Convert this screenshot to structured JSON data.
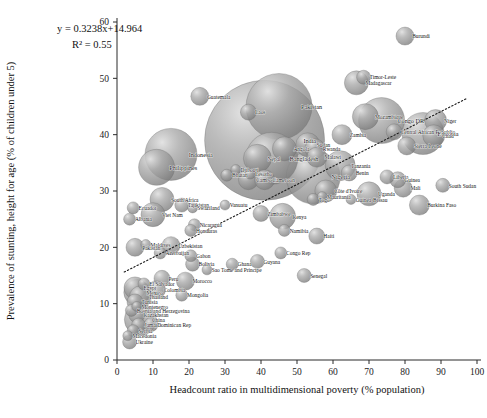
{
  "chart_data": {
    "type": "scatter",
    "title": "",
    "xlabel": "Headcount ratio in multidimensional poverty (% population)",
    "ylabel": "Prevalence of stunting, height for age (% of children under 5)",
    "xlim": [
      0,
      100
    ],
    "ylim": [
      0,
      60
    ],
    "xticks": [
      0,
      10,
      20,
      30,
      40,
      50,
      60,
      70,
      80,
      90,
      100
    ],
    "yticks": [
      0,
      10,
      20,
      30,
      40,
      50,
      60
    ],
    "grid": false,
    "legend": "none",
    "bubble_note": "Bubble area encodes population size; gray shaded spheres",
    "annotations": [
      {
        "name": "regression-equation",
        "text": "y = 0.3238x+14.964"
      },
      {
        "name": "r-squared",
        "text": "R² = 0.55"
      }
    ],
    "trendline": {
      "type": "linear",
      "style": "dotted",
      "slope": 0.3238,
      "intercept": 14.964,
      "r_squared": 0.55,
      "x_start": 2,
      "x_end": 97
    },
    "series": [
      {
        "name": "Countries",
        "points": [
          {
            "label": "Burundi",
            "x": 80.0,
            "y": 57.5,
            "size": 9
          },
          {
            "label": "Timor-Leste",
            "x": 68.5,
            "y": 50.2,
            "size": 7
          },
          {
            "label": "Madagascar",
            "x": 66.5,
            "y": 49.2,
            "size": 12
          },
          {
            "label": "Guatemala",
            "x": 23.0,
            "y": 46.8,
            "size": 9
          },
          {
            "label": "Pakistan",
            "x": 45.0,
            "y": 45.0,
            "size": 33
          },
          {
            "label": "Laos",
            "x": 36.5,
            "y": 44.0,
            "size": 8
          },
          {
            "label": "Mozambique",
            "x": 69.0,
            "y": 43.2,
            "size": 13
          },
          {
            "label": "Congo DR",
            "x": 73.5,
            "y": 42.5,
            "size": 23
          },
          {
            "label": "Niger",
            "x": 88.5,
            "y": 42.5,
            "size": 11
          },
          {
            "label": "India",
            "x": 41.0,
            "y": 39.0,
            "size": 60
          },
          {
            "label": "Zambia",
            "x": 62.5,
            "y": 40.0,
            "size": 10
          },
          {
            "label": "Central African Republic",
            "x": 77.0,
            "y": 40.5,
            "size": 8
          },
          {
            "label": "Ethiopia",
            "x": 85.0,
            "y": 40.2,
            "size": 21
          },
          {
            "label": "Chad",
            "x": 88.0,
            "y": 39.8,
            "size": 11
          },
          {
            "label": "Sierra Leone",
            "x": 80.5,
            "y": 38.0,
            "size": 9
          },
          {
            "label": "Sudan",
            "x": 53.0,
            "y": 38.2,
            "size": 12
          },
          {
            "label": "Rwanda",
            "x": 55.0,
            "y": 37.5,
            "size": 10
          },
          {
            "label": "Angola",
            "x": 46.5,
            "y": 37.5,
            "size": 12
          },
          {
            "label": "Malawi",
            "x": 55.5,
            "y": 36.0,
            "size": 10
          },
          {
            "label": "Indonesia",
            "x": 15.0,
            "y": 36.5,
            "size": 26
          },
          {
            "label": "Nepal",
            "x": 39.0,
            "y": 35.8,
            "size": 14
          },
          {
            "label": "Bangladesh",
            "x": 43.0,
            "y": 35.8,
            "size": 26
          },
          {
            "label": "Tanzania",
            "x": 62.0,
            "y": 34.5,
            "size": 15
          },
          {
            "label": "Philippines",
            "x": 11.0,
            "y": 34.2,
            "size": 18
          },
          {
            "label": "Djibouti",
            "x": 33.0,
            "y": 33.8,
            "size": 5
          },
          {
            "label": "Bhutan",
            "x": 30.5,
            "y": 32.8,
            "size": 6
          },
          {
            "label": "Lesotho",
            "x": 37.0,
            "y": 33.0,
            "size": 5
          },
          {
            "label": "Cambodia",
            "x": 36.5,
            "y": 32.0,
            "size": 10
          },
          {
            "label": "Cameroon",
            "x": 41.0,
            "y": 32.0,
            "size": 10
          },
          {
            "label": "Nigeria",
            "x": 54.5,
            "y": 32.5,
            "size": 27
          },
          {
            "label": "Benin",
            "x": 64.5,
            "y": 33.2,
            "size": 8
          },
          {
            "label": "Liberia",
            "x": 75.0,
            "y": 32.5,
            "size": 7
          },
          {
            "label": "Guinea",
            "x": 78.0,
            "y": 32.0,
            "size": 8
          },
          {
            "label": "South Sudan",
            "x": 90.5,
            "y": 31.0,
            "size": 7
          },
          {
            "label": "Côte d'Ivoire",
            "x": 58.0,
            "y": 30.0,
            "size": 11
          },
          {
            "label": "Mali",
            "x": 79.5,
            "y": 30.5,
            "size": 9
          },
          {
            "label": "Uganda",
            "x": 70.0,
            "y": 29.5,
            "size": 12
          },
          {
            "label": "Togo",
            "x": 54.5,
            "y": 28.5,
            "size": 6
          },
          {
            "label": "Mauritania",
            "x": 57.0,
            "y": 29.0,
            "size": 5
          },
          {
            "label": "Guinea-Bissau",
            "x": 65.0,
            "y": 28.5,
            "size": 5
          },
          {
            "label": "Burkina Faso",
            "x": 84.0,
            "y": 27.5,
            "size": 10
          },
          {
            "label": "South Africa",
            "x": 12.5,
            "y": 28.5,
            "size": 12
          },
          {
            "label": "Tajikistan",
            "x": 18.0,
            "y": 27.5,
            "size": 7
          },
          {
            "label": "Swaziland",
            "x": 21.0,
            "y": 27.0,
            "size": 5
          },
          {
            "label": "Ecuador",
            "x": 4.5,
            "y": 27.0,
            "size": 6
          },
          {
            "label": "Viet Nam",
            "x": 10.0,
            "y": 25.8,
            "size": 12
          },
          {
            "label": "Albania",
            "x": 3.5,
            "y": 25.0,
            "size": 6
          },
          {
            "label": "Vanuatu",
            "x": 30.0,
            "y": 27.5,
            "size": 5
          },
          {
            "label": "Zimbabwe",
            "x": 40.0,
            "y": 26.0,
            "size": 8
          },
          {
            "label": "Kenya",
            "x": 46.0,
            "y": 25.5,
            "size": 13
          },
          {
            "label": "Nicaragua",
            "x": 21.5,
            "y": 24.0,
            "size": 6
          },
          {
            "label": "Honduras",
            "x": 20.5,
            "y": 23.0,
            "size": 6
          },
          {
            "label": "Namibia",
            "x": 46.5,
            "y": 23.0,
            "size": 6
          },
          {
            "label": "Haiti",
            "x": 55.5,
            "y": 22.0,
            "size": 8
          },
          {
            "label": "Maldives",
            "x": 8.0,
            "y": 20.5,
            "size": 5
          },
          {
            "label": "Uzbekistan",
            "x": 15.0,
            "y": 20.3,
            "size": 9
          },
          {
            "label": "Pakistan2",
            "x": 5.0,
            "y": 20.0,
            "size": 9
          },
          {
            "label": "Azerbaijan",
            "x": 12.0,
            "y": 19.0,
            "size": 6
          },
          {
            "label": "Gabon",
            "x": 20.5,
            "y": 18.5,
            "size": 6
          },
          {
            "label": "Bolivia",
            "x": 21.0,
            "y": 17.0,
            "size": 7
          },
          {
            "label": "Guyana",
            "x": 39.0,
            "y": 17.5,
            "size": 7
          },
          {
            "label": "Ghana",
            "x": 32.0,
            "y": 17.0,
            "size": 6
          },
          {
            "label": "Congo Rep",
            "x": 45.5,
            "y": 19.0,
            "size": 6
          },
          {
            "label": "Sao Tome and Principe",
            "x": 25.0,
            "y": 16.0,
            "size": 5
          },
          {
            "label": "Senegal",
            "x": 52.0,
            "y": 15.0,
            "size": 7
          },
          {
            "label": "Peru",
            "x": 12.5,
            "y": 14.5,
            "size": 8
          },
          {
            "label": "Morocco",
            "x": 19.0,
            "y": 14.0,
            "size": 9
          },
          {
            "label": "El Salvador",
            "x": 7.5,
            "y": 13.5,
            "size": 6
          },
          {
            "label": "Colombia",
            "x": 11.0,
            "y": 12.5,
            "size": 9
          },
          {
            "label": "Mongolia",
            "x": 18.0,
            "y": 11.5,
            "size": 6
          },
          {
            "label": "Egypt",
            "x": 5.0,
            "y": 12.8,
            "size": 11
          },
          {
            "label": "Mexico",
            "x": 5.5,
            "y": 12.0,
            "size": 13
          },
          {
            "label": "Thailand",
            "x": 6.5,
            "y": 11.2,
            "size": 11
          },
          {
            "label": "Tunisia",
            "x": 5.0,
            "y": 10.3,
            "size": 8
          },
          {
            "label": "Montenegro",
            "x": 5.5,
            "y": 9.5,
            "size": 5
          },
          {
            "label": "Bosnia and Herzegovina",
            "x": 4.0,
            "y": 8.8,
            "size": 6
          },
          {
            "label": "Kazakhstan",
            "x": 5.5,
            "y": 8.0,
            "size": 8
          },
          {
            "label": "China",
            "x": 6.5,
            "y": 7.2,
            "size": 16
          },
          {
            "label": "Jamaica",
            "x": 6.0,
            "y": 6.2,
            "size": 7
          },
          {
            "label": "Dominican Rep",
            "x": 9.5,
            "y": 6.3,
            "size": 7
          },
          {
            "label": "Serbia",
            "x": 4.5,
            "y": 5.2,
            "size": 6
          },
          {
            "label": "Macedonia",
            "x": 3.0,
            "y": 4.3,
            "size": 5
          },
          {
            "label": "Ukraine",
            "x": 3.5,
            "y": 3.2,
            "size": 7
          }
        ]
      }
    ]
  },
  "style": {
    "bubble_fill": "#8f8f8f",
    "bubble_stroke": "#6a6a6a",
    "bubble_highlight": "#d8d8d8",
    "axis_color": "#2b2b2b",
    "trendline_color": "#1a1a1a",
    "background": "#ffffff"
  }
}
